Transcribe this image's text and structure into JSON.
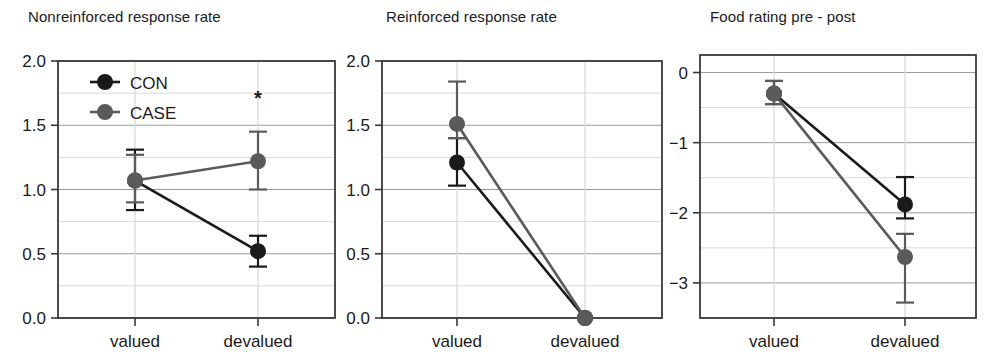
{
  "figure": {
    "background": "#ffffff",
    "axis_color": "#3a3a3a",
    "grid_major_color": "#9a9a9a",
    "grid_minor_color": "#d8d8d8"
  },
  "series_style": {
    "CON": {
      "color": "#1a1a1a",
      "label": "CON"
    },
    "CASE": {
      "color": "#5a5a5a",
      "label": "CASE"
    }
  },
  "legend": {
    "present_in_panel": 0,
    "entries": [
      {
        "label": "CON",
        "color": "#1a1a1a"
      },
      {
        "label": "CASE",
        "color": "#5a5a5a"
      }
    ]
  },
  "chart_data": [
    {
      "type": "line",
      "title": "Nonreinforced response rate",
      "xlabel": "",
      "ylabel": "",
      "categories": [
        "valued",
        "devalued"
      ],
      "ylim": [
        0.0,
        2.0
      ],
      "yticks": [
        0.0,
        0.5,
        1.0,
        1.5,
        2.0
      ],
      "ytick_labels": [
        "0.0",
        "0.5",
        "1.0",
        "1.5",
        "2.0"
      ],
      "yminor_step": 0.25,
      "grid": true,
      "legend_position": "top-left",
      "annotations": [
        {
          "text": "*",
          "category": "devalued",
          "value": 1.72
        }
      ],
      "series": [
        {
          "name": "CON",
          "color": "#1a1a1a",
          "values": [
            1.07,
            0.52
          ],
          "err_low": [
            0.84,
            0.4
          ],
          "err_high": [
            1.31,
            0.64
          ]
        },
        {
          "name": "CASE",
          "color": "#5a5a5a",
          "values": [
            1.07,
            1.22
          ],
          "err_low": [
            0.9,
            1.0
          ],
          "err_high": [
            1.27,
            1.45
          ]
        }
      ]
    },
    {
      "type": "line",
      "title": "Reinforced response rate",
      "xlabel": "",
      "ylabel": "",
      "categories": [
        "valued",
        "devalued"
      ],
      "ylim": [
        0.0,
        2.0
      ],
      "yticks": [
        0.0,
        0.5,
        1.0,
        1.5,
        2.0
      ],
      "ytick_labels": [
        "0.0",
        "0.5",
        "1.0",
        "1.5",
        "2.0"
      ],
      "yminor_step": 0.25,
      "grid": true,
      "legend_position": "none",
      "annotations": [],
      "series": [
        {
          "name": "CON",
          "color": "#1a1a1a",
          "values": [
            1.21,
            0.0
          ],
          "err_low": [
            1.03,
            0.0
          ],
          "err_high": [
            1.4,
            0.0
          ]
        },
        {
          "name": "CASE",
          "color": "#5a5a5a",
          "values": [
            1.51,
            0.0
          ],
          "err_low": [
            1.4,
            0.0
          ],
          "err_high": [
            1.84,
            0.0
          ]
        }
      ]
    },
    {
      "type": "line",
      "title": "Food rating pre - post",
      "xlabel": "",
      "ylabel": "",
      "categories": [
        "valued",
        "devalued"
      ],
      "ylim": [
        -3.5,
        0.25
      ],
      "yticks": [
        0,
        -1,
        -2,
        -3
      ],
      "ytick_labels": [
        "0",
        "−1",
        "−2",
        "−3"
      ],
      "yminor_step": 0.5,
      "grid": true,
      "legend_position": "none",
      "annotations": [],
      "series": [
        {
          "name": "CON",
          "color": "#1a1a1a",
          "values": [
            -0.3,
            -1.88
          ],
          "err_low": [
            -0.45,
            -2.08
          ],
          "err_high": [
            -0.12,
            -1.49
          ]
        },
        {
          "name": "CASE",
          "color": "#5a5a5a",
          "values": [
            -0.3,
            -2.63
          ],
          "err_low": [
            -0.45,
            -3.28
          ],
          "err_high": [
            -0.12,
            -2.3
          ]
        }
      ]
    }
  ]
}
